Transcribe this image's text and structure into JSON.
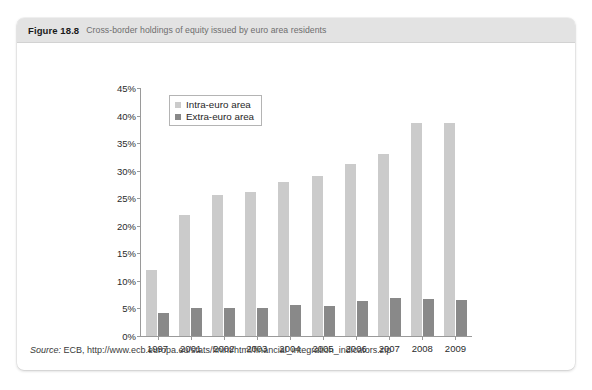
{
  "figure": {
    "number": "Figure 18.8",
    "caption": "Cross-border holdings of equity issued by euro area residents",
    "source_label": "Source:",
    "source_text": " ECB, http://www.ecb.europa.eu/stats/finint/html/financial_integration_indicators.zip"
  },
  "colors": {
    "intra": "#cbcbcb",
    "extra": "#898989",
    "header_band": "#e3e3e3",
    "axis": "#9a9a9a",
    "text": "#2b2b2b"
  },
  "chart_data": {
    "type": "bar",
    "title": "Cross-border holdings of equity issued by euro area residents",
    "xlabel": "",
    "ylabel": "",
    "ylim": [
      0,
      45
    ],
    "ytick_labels": [
      "0%",
      "5%",
      "10%",
      "15%",
      "20%",
      "25%",
      "30%",
      "35%",
      "40%",
      "45%"
    ],
    "ytick_values": [
      0,
      5,
      10,
      15,
      20,
      25,
      30,
      35,
      40,
      45
    ],
    "grid": false,
    "legend_position": "top-left inside plot",
    "categories": [
      "1997",
      "2001",
      "2002",
      "2003",
      "2004",
      "2005",
      "2006",
      "2007",
      "2008",
      "2009"
    ],
    "series": [
      {
        "name": "Intra-euro area",
        "color": "#cbcbcb",
        "values": [
          12.0,
          22.0,
          25.5,
          26.2,
          28.0,
          29.0,
          31.3,
          33.0,
          38.7,
          38.7
        ]
      },
      {
        "name": "Extra-euro area",
        "color": "#898989",
        "values": [
          4.2,
          5.1,
          5.0,
          5.0,
          5.6,
          5.5,
          6.3,
          6.9,
          6.7,
          6.5
        ]
      }
    ]
  }
}
